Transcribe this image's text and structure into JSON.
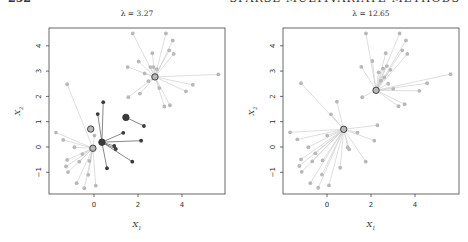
{
  "page_header": {
    "page_number": "252",
    "running_title": "SPARSE MULTIVARIATE METHODS"
  },
  "chart_data": [
    {
      "type": "scatter",
      "title": "λ = 3.27",
      "xlabel": "X1",
      "ylabel": "X2",
      "xlim": [
        -2.05,
        5.95
      ],
      "ylim": [
        -1.85,
        4.7
      ],
      "xticks": [
        0,
        2,
        4
      ],
      "yticks": [
        -1,
        0,
        1,
        2,
        3,
        4
      ],
      "grid": false,
      "legend": null,
      "clusters": [
        {
          "name": "upper",
          "shade": "light",
          "center": [
            2.77,
            2.77
          ],
          "points": [
            [
              1.76,
              4.49
            ],
            [
              3.27,
              4.49
            ],
            [
              3.58,
              4.21
            ],
            [
              3.42,
              3.82
            ],
            [
              3.62,
              3.68
            ],
            [
              2.65,
              3.71
            ],
            [
              2.03,
              3.38
            ],
            [
              1.53,
              3.16
            ],
            [
              2.3,
              2.91
            ],
            [
              2.56,
              3.16
            ],
            [
              2.7,
              3.16
            ],
            [
              2.85,
              3.08
            ],
            [
              5.65,
              2.87
            ],
            [
              4.49,
              2.46
            ],
            [
              4.18,
              2.2
            ],
            [
              2.97,
              2.33
            ],
            [
              2.47,
              2.6
            ],
            [
              2.09,
              2.11
            ],
            [
              1.56,
              1.97
            ],
            [
              3.2,
              1.6
            ],
            [
              3.45,
              1.65
            ]
          ]
        },
        {
          "name": "lower-left",
          "shade": "light",
          "center": [
            -0.05,
            -0.05
          ],
          "points": [
            [
              -1.22,
              2.48
            ],
            [
              -1.73,
              0.57
            ],
            [
              -1.4,
              0.28
            ],
            [
              -0.89,
              -0.01
            ],
            [
              -0.53,
              -0.28
            ],
            [
              -1.22,
              -0.51
            ],
            [
              -0.67,
              -0.58
            ],
            [
              -1.27,
              -0.77
            ],
            [
              -1.18,
              -0.99
            ],
            [
              -0.21,
              -0.55
            ],
            [
              -0.26,
              -1.1
            ],
            [
              -0.79,
              -1.43
            ],
            [
              -0.44,
              -1.63
            ],
            [
              0.08,
              -1.53
            ],
            [
              0.02,
              0.45
            ]
          ]
        },
        {
          "name": "middle",
          "shade": "dark",
          "center": [
            0.36,
            0.19
          ],
          "points": [
            [
              0.42,
              1.77
            ],
            [
              0.17,
              1.3
            ],
            [
              1.33,
              0.56
            ],
            [
              2.14,
              0.25
            ],
            [
              0.92,
              0.04
            ],
            [
              0.99,
              -0.08
            ],
            [
              1.74,
              -0.58
            ],
            [
              0.59,
              -0.84
            ]
          ]
        },
        {
          "name": "small-dark",
          "shade": "dark",
          "center": [
            1.45,
            1.17
          ],
          "points": [
            [
              2.27,
              0.83
            ]
          ]
        },
        {
          "name": "lone-light",
          "shade": "light",
          "center": [
            -0.15,
            0.71
          ],
          "points": []
        }
      ]
    },
    {
      "type": "scatter",
      "title": "λ = 12.65",
      "xlabel": "X1",
      "ylabel": "X2",
      "xlim": [
        -2.0,
        6.0
      ],
      "ylim": [
        -1.85,
        4.7
      ],
      "xticks": [
        0,
        2,
        4
      ],
      "yticks": [
        -1,
        0,
        1,
        2,
        3,
        4
      ],
      "grid": false,
      "legend": null,
      "clusters": [
        {
          "name": "upper",
          "shade": "light",
          "center": [
            2.23,
            2.24
          ],
          "points": [
            [
              1.77,
              4.49
            ],
            [
              3.3,
              4.49
            ],
            [
              3.59,
              4.21
            ],
            [
              3.42,
              3.82
            ],
            [
              3.65,
              3.68
            ],
            [
              2.67,
              3.71
            ],
            [
              2.06,
              3.4
            ],
            [
              1.56,
              3.17
            ],
            [
              2.35,
              2.95
            ],
            [
              2.55,
              3.1
            ],
            [
              2.72,
              3.2
            ],
            [
              2.88,
              3.05
            ],
            [
              2.6,
              2.75
            ],
            [
              2.45,
              2.62
            ],
            [
              2.78,
              2.5
            ],
            [
              5.62,
              2.88
            ],
            [
              4.55,
              2.52
            ],
            [
              4.2,
              2.22
            ],
            [
              3.01,
              2.3
            ],
            [
              1.6,
              1.97
            ],
            [
              3.25,
              1.61
            ],
            [
              3.53,
              1.69
            ]
          ]
        },
        {
          "name": "lower",
          "shade": "light",
          "center": [
            0.76,
            0.7
          ],
          "points": [
            [
              -1.18,
              2.52
            ],
            [
              0.45,
              1.79
            ],
            [
              0.18,
              1.29
            ],
            [
              2.29,
              0.86
            ],
            [
              -1.68,
              0.58
            ],
            [
              -1.35,
              0.3
            ],
            [
              0.01,
              0.45
            ],
            [
              1.38,
              0.57
            ],
            [
              2.15,
              0.25
            ],
            [
              -0.85,
              -0.01
            ],
            [
              -0.53,
              -0.25
            ],
            [
              0.94,
              -0.01
            ],
            [
              1.01,
              -0.09
            ],
            [
              -1.18,
              -0.49
            ],
            [
              -0.67,
              -0.57
            ],
            [
              -0.2,
              -0.53
            ],
            [
              -1.26,
              -0.75
            ],
            [
              -1.15,
              -0.98
            ],
            [
              0.6,
              -0.82
            ],
            [
              1.76,
              -0.58
            ],
            [
              -0.23,
              -1.09
            ],
            [
              -0.76,
              -1.43
            ],
            [
              -0.4,
              -1.61
            ],
            [
              0.09,
              -1.52
            ]
          ]
        }
      ]
    }
  ],
  "colors": {
    "light_point": "#b8b8b8",
    "light_line": "#d0d0d0",
    "dark_point": "#3a3a3a",
    "dark_line": "#555555",
    "axis": "#444444",
    "center_ring": "#333333"
  },
  "layout": {
    "panels": [
      {
        "box": [
          49,
          28,
          225,
          194
        ],
        "x0_px": 94,
        "px_per_x": 22,
        "y0_px": 147,
        "px_per_y": 25.3,
        "title_x": 137,
        "ylabel_x": 20,
        "xlabel_y": 227
      },
      {
        "box": [
          283,
          28,
          459,
          194
        ],
        "x0_px": 327,
        "px_per_x": 22,
        "y0_px": 147,
        "px_per_y": 25.3,
        "title_x": 371,
        "ylabel_x": 254,
        "xlabel_y": 227
      }
    ]
  }
}
